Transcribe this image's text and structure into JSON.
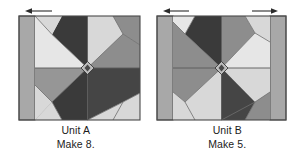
{
  "figure": {
    "title": "Quilt block piecing units",
    "background": "#ffffff",
    "units": [
      {
        "id": "unit-a",
        "name_label": "Unit A",
        "make_label": "Make 8.",
        "strips": [
          "left"
        ],
        "arrows": [
          {
            "direction": "left",
            "label": "seam-direction-arrow-left"
          }
        ],
        "center_label": "center-square-on-point"
      },
      {
        "id": "unit-b",
        "name_label": "Unit B",
        "make_label": "Make 5.",
        "strips": [
          "left",
          "right"
        ],
        "arrows": [
          {
            "direction": "left",
            "label": "seam-direction-arrow-left"
          },
          {
            "direction": "right",
            "label": "seam-direction-arrow-right"
          }
        ],
        "center_label": "center-square-on-point"
      }
    ]
  },
  "colors": {
    "fabric_dark": "#3a3a3a",
    "fabric_dark2": "#454545",
    "fabric_medium": "#8d8d8d",
    "fabric_medium2": "#969696",
    "fabric_light": "#d8d8d8",
    "fabric_lightest": "#e6e6e6",
    "fabric_strip": "#a8a8a8",
    "outline": "#4a4a4a",
    "text": "#1b1b1b",
    "arrow": "#2b2b2b",
    "page_background": "#ffffff"
  }
}
